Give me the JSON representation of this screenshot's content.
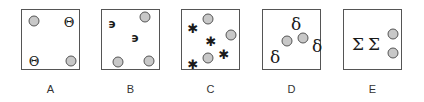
{
  "panels": [
    {
      "label": "A",
      "left": 21,
      "symbol": "Θ",
      "dots": [
        [
          12,
          11
        ],
        [
          49,
          51
        ]
      ],
      "symbols": [
        [
          47,
          12
        ],
        [
          12,
          51
        ]
      ]
    },
    {
      "label": "B",
      "left": 101,
      "symbol": "϶",
      "dots": [
        [
          43,
          7
        ],
        [
          16,
          52
        ],
        [
          47,
          51
        ]
      ],
      "symbols": [
        [
          10,
          14
        ],
        [
          33,
          28
        ]
      ]
    },
    {
      "label": "C",
      "left": 181,
      "symbol": "✱",
      "dots": [
        [
          26,
          9
        ],
        [
          49,
          25
        ],
        [
          26,
          48
        ]
      ],
      "symbols": [
        [
          11,
          18
        ],
        [
          29,
          31
        ],
        [
          42,
          44
        ],
        [
          11,
          54
        ]
      ]
    },
    {
      "label": "D",
      "left": 262,
      "symbol": "δ",
      "dots": [
        [
          24,
          31
        ],
        [
          40,
          28
        ]
      ],
      "symbols": [
        [
          33,
          14
        ],
        [
          54,
          36
        ],
        [
          12,
          47
        ]
      ]
    },
    {
      "label": "E",
      "left": 343,
      "symbol": "Σ",
      "dots": [
        [
          49,
          24
        ],
        [
          49,
          43
        ]
      ],
      "symbols": [
        [
          14,
          34
        ],
        [
          30,
          34
        ]
      ]
    }
  ],
  "labels": {
    "A": "A",
    "B": "B",
    "C": "C",
    "D": "D",
    "E": "E"
  }
}
